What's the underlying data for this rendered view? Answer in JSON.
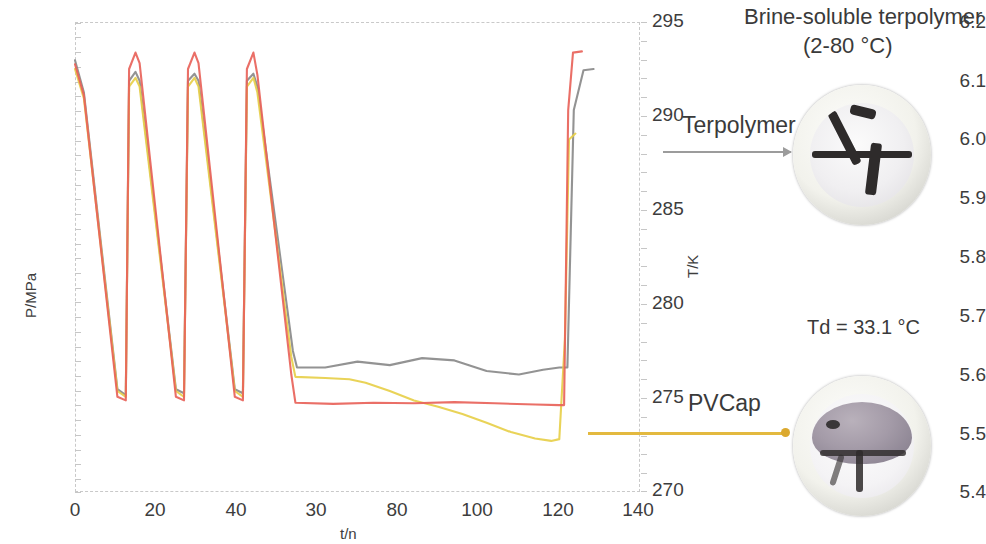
{
  "figure": {
    "title": "Brine-soluble terpolymer",
    "subtitle": "(2-80 °C)",
    "td_label": "Td = 33.1 °C",
    "callout_terpolymer": "Terpolymer",
    "callout_pvcap": "PVCap"
  },
  "chart_data": {
    "type": "line",
    "title": "",
    "xlabel": "t/n",
    "ylabel": "P/MPa",
    "y2label": "T/K",
    "xlim": [
      0,
      140
    ],
    "ylim": [
      5.4,
      6.2
    ],
    "y2lim": [
      270,
      295
    ],
    "grid": false,
    "legend_position": "none",
    "xticks": [
      0,
      20,
      40,
      30,
      80,
      100,
      120,
      140
    ],
    "yticks": [
      "5.4",
      "5.5",
      "5.6",
      "5.7",
      "5.8",
      "5.9",
      "6.0",
      "6.1",
      "6.2"
    ],
    "y2ticks": [
      270,
      275,
      280,
      285,
      290,
      295
    ],
    "colors": {
      "terpolymer": "#8a8a8a",
      "pvcap": "#e7cf4a",
      "blank": "#e8635a",
      "frame": "#c9c9c9",
      "arrow_gray": "#9c9c9c",
      "arrow_gold": "#e3b93f"
    },
    "series": [
      {
        "name": "Terpolymer",
        "color": "#8a8a8a",
        "points": [
          [
            0,
            6.135
          ],
          [
            2.2,
            6.08
          ],
          [
            10.5,
            5.575
          ],
          [
            12.6,
            5.565
          ],
          [
            13.4,
            6.1
          ],
          [
            15.0,
            6.115
          ],
          [
            16.0,
            6.1
          ],
          [
            25.0,
            5.575
          ],
          [
            27.0,
            5.568
          ],
          [
            28.0,
            6.1
          ],
          [
            29.6,
            6.112
          ],
          [
            30.6,
            6.1
          ],
          [
            39.6,
            5.575
          ],
          [
            41.6,
            5.568
          ],
          [
            42.6,
            6.1
          ],
          [
            44.2,
            6.112
          ],
          [
            45.2,
            6.09
          ],
          [
            54.0,
            5.64
          ],
          [
            55.0,
            5.612
          ],
          [
            62.0,
            5.612
          ],
          [
            70.0,
            5.622
          ],
          [
            78.0,
            5.616
          ],
          [
            86.0,
            5.628
          ],
          [
            94.0,
            5.624
          ],
          [
            102.0,
            5.606
          ],
          [
            110.0,
            5.6
          ],
          [
            116.0,
            5.608
          ],
          [
            120.0,
            5.612
          ],
          [
            122.0,
            5.612
          ],
          [
            123.6,
            6.05
          ],
          [
            126.0,
            6.118
          ],
          [
            128.5,
            6.12
          ]
        ]
      },
      {
        "name": "PVCap",
        "color": "#e7cf4a",
        "points": [
          [
            0,
            6.12
          ],
          [
            2.2,
            6.07
          ],
          [
            10.5,
            5.572
          ],
          [
            12.6,
            5.562
          ],
          [
            13.4,
            6.09
          ],
          [
            15.0,
            6.105
          ],
          [
            16.0,
            6.09
          ],
          [
            25.0,
            5.572
          ],
          [
            27.0,
            5.562
          ],
          [
            28.0,
            6.09
          ],
          [
            29.6,
            6.105
          ],
          [
            30.6,
            6.09
          ],
          [
            39.6,
            5.572
          ],
          [
            41.6,
            5.562
          ],
          [
            42.6,
            6.09
          ],
          [
            44.2,
            6.105
          ],
          [
            45.2,
            6.08
          ],
          [
            53.6,
            5.63
          ],
          [
            54.6,
            5.596
          ],
          [
            62.0,
            5.594
          ],
          [
            68.0,
            5.592
          ],
          [
            72.0,
            5.586
          ],
          [
            78.0,
            5.572
          ],
          [
            84.0,
            5.556
          ],
          [
            90.0,
            5.545
          ],
          [
            96.0,
            5.533
          ],
          [
            102.0,
            5.518
          ],
          [
            108.0,
            5.502
          ],
          [
            114.0,
            5.491
          ],
          [
            118.0,
            5.487
          ],
          [
            120.0,
            5.49
          ],
          [
            121.4,
            5.66
          ],
          [
            122.4,
            6.0
          ],
          [
            124.0,
            6.01
          ]
        ]
      },
      {
        "name": "Blank",
        "color": "#e8635a",
        "points": [
          [
            0,
            6.128
          ],
          [
            2.2,
            6.075
          ],
          [
            10.5,
            5.562
          ],
          [
            12.6,
            5.556
          ],
          [
            13.4,
            6.12
          ],
          [
            15.0,
            6.148
          ],
          [
            16.0,
            6.13
          ],
          [
            25.0,
            5.562
          ],
          [
            27.0,
            5.556
          ],
          [
            28.0,
            6.12
          ],
          [
            29.6,
            6.148
          ],
          [
            30.6,
            6.13
          ],
          [
            39.6,
            5.562
          ],
          [
            41.6,
            5.556
          ],
          [
            42.6,
            6.12
          ],
          [
            44.2,
            6.148
          ],
          [
            45.2,
            6.11
          ],
          [
            53.6,
            5.6
          ],
          [
            54.6,
            5.552
          ],
          [
            64.0,
            5.55
          ],
          [
            74.0,
            5.552
          ],
          [
            84.0,
            5.551
          ],
          [
            94.0,
            5.553
          ],
          [
            104.0,
            5.551
          ],
          [
            114.0,
            5.549
          ],
          [
            120.0,
            5.548
          ],
          [
            121.2,
            5.548
          ],
          [
            122.2,
            6.05
          ],
          [
            123.4,
            6.148
          ],
          [
            125.6,
            6.15
          ]
        ]
      }
    ]
  }
}
